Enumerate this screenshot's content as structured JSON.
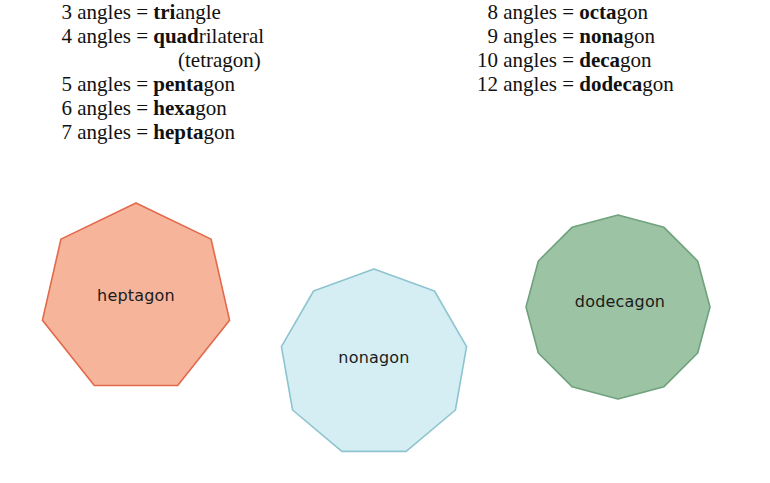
{
  "legend": {
    "left_column": [
      {
        "count": "3",
        "middle": " angles = ",
        "bold": "tri",
        "rest": "angle"
      },
      {
        "count": "4",
        "middle": " angles = ",
        "bold": "quad",
        "rest": "rilateral"
      },
      {
        "count": "",
        "middle": "",
        "bold": "",
        "rest": "(tetragon)",
        "continuation": true
      },
      {
        "count": "5",
        "middle": " angles = ",
        "bold": "penta",
        "rest": "gon"
      },
      {
        "count": "6",
        "middle": " angles = ",
        "bold": "hexa",
        "rest": "gon"
      },
      {
        "count": "7",
        "middle": " angles = ",
        "bold": "hepta",
        "rest": "gon"
      }
    ],
    "right_column": [
      {
        "count": "8",
        "middle": " angles = ",
        "bold": "octa",
        "rest": "gon"
      },
      {
        "count": "9",
        "middle": " angles = ",
        "bold": "nona",
        "rest": "gon"
      },
      {
        "count": "10",
        "middle": " angles = ",
        "bold": "deca",
        "rest": "gon"
      },
      {
        "count": "12",
        "middle": " angles = ",
        "bold": "dodeca",
        "rest": "gon"
      }
    ]
  },
  "shapes": [
    {
      "name": "heptagon",
      "label": "heptagon",
      "sides": 7,
      "cx": 136,
      "cy": 299,
      "radius": 96,
      "rotation": -90,
      "fill": "#f6b49b",
      "stroke": "#e2694a",
      "label_x": 136,
      "label_y": 295
    },
    {
      "name": "nonagon",
      "label": "nonagon",
      "sides": 9,
      "cx": 374,
      "cy": 363,
      "radius": 94,
      "rotation": -90,
      "fill": "#d4eef4",
      "stroke": "#8ec4cf",
      "label_x": 374,
      "label_y": 357
    },
    {
      "name": "dodecagon",
      "label": "dodecagon",
      "sides": 12,
      "cx": 618,
      "cy": 307,
      "radius": 92,
      "rotation": -90,
      "fill": "#9bc3a4",
      "stroke": "#6fa27c",
      "label_x": 620,
      "label_y": 301
    }
  ],
  "colors": {
    "background": "#ffffff",
    "text": "#111111",
    "heptagon_fill": "#f6b49b",
    "heptagon_stroke": "#e2694a",
    "nonagon_fill": "#d4eef4",
    "nonagon_stroke": "#8ec4cf",
    "dodecagon_fill": "#9bc3a4",
    "dodecagon_stroke": "#6fa27c"
  }
}
